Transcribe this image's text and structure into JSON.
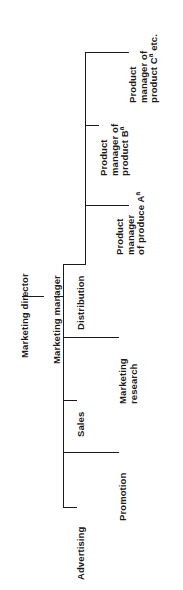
{
  "figure": {
    "type": "org-chart",
    "orientation": "rotated-90-ccw",
    "line_color": "#1b1b1b",
    "background_color": "#ffffff"
  },
  "nodes": {
    "director": {
      "label": "Marketing director",
      "bold": true
    },
    "manager": {
      "label": "Marketing manager",
      "bold": true
    },
    "functions": [
      {
        "label": "Advertising",
        "bold": true
      },
      {
        "label": "Promotion",
        "bold": true
      },
      {
        "label": "Sales",
        "bold": true
      },
      {
        "label": "Marketing research",
        "line1": "Marketing",
        "line2": "research",
        "bold": true
      },
      {
        "label": "Distribution",
        "bold": true
      }
    ],
    "product_managers": [
      {
        "label": "Product manager of produce A",
        "line1": "Product",
        "line2": "manager",
        "line3": "of produce A",
        "superscript": "a",
        "bold": true
      },
      {
        "label": "Product manager of product B",
        "line1": "Product",
        "line2": "manager of",
        "line3": "product B",
        "superscript": "a",
        "bold": true
      },
      {
        "label": "Product manager of product C etc.",
        "line1": "Product",
        "line2": "manager of",
        "line3": "product C",
        "superscript": "a",
        "line3_tail": " etc.",
        "bold": true
      }
    ]
  }
}
